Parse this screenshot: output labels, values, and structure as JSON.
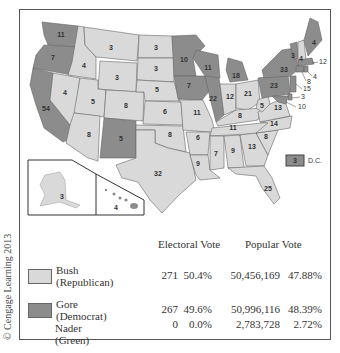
{
  "colors": {
    "republican": "#d9d9d9",
    "democrat": "#8c8c8c",
    "border": "#555555"
  },
  "credit": "© Cengage Learning 2013",
  "map": {
    "states": [
      {
        "abbr": "WA",
        "ev": "11",
        "party": "D"
      },
      {
        "abbr": "OR",
        "ev": "7",
        "party": "D"
      },
      {
        "abbr": "CA",
        "ev": "54",
        "party": "D"
      },
      {
        "abbr": "ID",
        "ev": "4",
        "party": "R"
      },
      {
        "abbr": "NV",
        "ev": "4",
        "party": "R"
      },
      {
        "abbr": "MT",
        "ev": "3",
        "party": "R"
      },
      {
        "abbr": "WY",
        "ev": "3",
        "party": "R"
      },
      {
        "abbr": "UT",
        "ev": "5",
        "party": "R"
      },
      {
        "abbr": "AZ",
        "ev": "8",
        "party": "R"
      },
      {
        "abbr": "CO",
        "ev": "8",
        "party": "R"
      },
      {
        "abbr": "NM",
        "ev": "5",
        "party": "D"
      },
      {
        "abbr": "ND",
        "ev": "3",
        "party": "R"
      },
      {
        "abbr": "SD",
        "ev": "3",
        "party": "R"
      },
      {
        "abbr": "NE",
        "ev": "5",
        "party": "R"
      },
      {
        "abbr": "KS",
        "ev": "6",
        "party": "R"
      },
      {
        "abbr": "OK",
        "ev": "8",
        "party": "R"
      },
      {
        "abbr": "TX",
        "ev": "32",
        "party": "R"
      },
      {
        "abbr": "MN",
        "ev": "10",
        "party": "D"
      },
      {
        "abbr": "IA",
        "ev": "7",
        "party": "D"
      },
      {
        "abbr": "MO",
        "ev": "11",
        "party": "R"
      },
      {
        "abbr": "AR",
        "ev": "6",
        "party": "R"
      },
      {
        "abbr": "LA",
        "ev": "9",
        "party": "R"
      },
      {
        "abbr": "WI",
        "ev": "11",
        "party": "D"
      },
      {
        "abbr": "IL",
        "ev": "22",
        "party": "D"
      },
      {
        "abbr": "MI",
        "ev": "18",
        "party": "D"
      },
      {
        "abbr": "IN",
        "ev": "12",
        "party": "R"
      },
      {
        "abbr": "OH",
        "ev": "21",
        "party": "R"
      },
      {
        "abbr": "KY",
        "ev": "8",
        "party": "R"
      },
      {
        "abbr": "TN",
        "ev": "11",
        "party": "R"
      },
      {
        "abbr": "MS",
        "ev": "7",
        "party": "R"
      },
      {
        "abbr": "AL",
        "ev": "9",
        "party": "R"
      },
      {
        "abbr": "GA",
        "ev": "13",
        "party": "R"
      },
      {
        "abbr": "FL",
        "ev": "25",
        "party": "R"
      },
      {
        "abbr": "SC",
        "ev": "8",
        "party": "R"
      },
      {
        "abbr": "NC",
        "ev": "14",
        "party": "R"
      },
      {
        "abbr": "VA",
        "ev": "13",
        "party": "R"
      },
      {
        "abbr": "WV",
        "ev": "5",
        "party": "R"
      },
      {
        "abbr": "PA",
        "ev": "23",
        "party": "D"
      },
      {
        "abbr": "NY",
        "ev": "33",
        "party": "D"
      },
      {
        "abbr": "VT",
        "ev": "3",
        "party": "D"
      },
      {
        "abbr": "NH",
        "ev": "4",
        "party": "R"
      },
      {
        "abbr": "ME",
        "ev": "4",
        "party": "D"
      },
      {
        "abbr": "MA",
        "ev": "12",
        "party": "D"
      },
      {
        "abbr": "RI",
        "ev": "4",
        "party": "D"
      },
      {
        "abbr": "CT",
        "ev": "8",
        "party": "D"
      },
      {
        "abbr": "NJ",
        "ev": "15",
        "party": "D"
      },
      {
        "abbr": "DE",
        "ev": "3",
        "party": "D"
      },
      {
        "abbr": "MD",
        "ev": "10",
        "party": "D"
      },
      {
        "abbr": "AK",
        "ev": "3",
        "party": "R"
      },
      {
        "abbr": "HI",
        "ev": "4",
        "party": "D"
      }
    ],
    "dc": {
      "ev": "3",
      "label": "D.C.",
      "party": "D"
    }
  },
  "table": {
    "headers": {
      "electoral": "Electoral Vote",
      "popular": "Popular Vote"
    },
    "rows": [
      {
        "name": "Bush",
        "party": "(Republican)",
        "ev": "271",
        "ev_pct": "50.4%",
        "pop": "50,456,169",
        "pop_pct": "47.88%",
        "swatch": "republican"
      },
      {
        "name": "Gore",
        "party": "(Democrat)",
        "ev": "267",
        "ev_pct": "49.6%",
        "pop": "50,996,116",
        "pop_pct": "48.39%",
        "swatch": "democrat"
      },
      {
        "name": "Nader",
        "party": "(Green)",
        "ev": "0",
        "ev_pct": "0.0%",
        "pop": "2,783,728",
        "pop_pct": "2.72%",
        "swatch": null
      }
    ]
  }
}
